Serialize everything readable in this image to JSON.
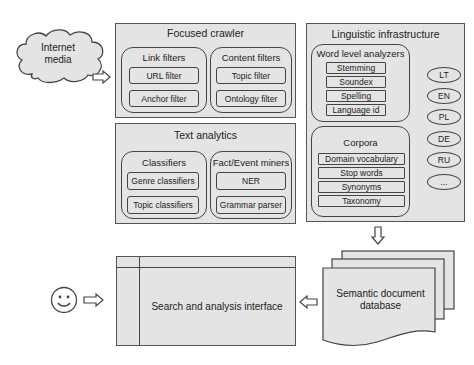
{
  "source": {
    "label_line1": "Internet",
    "label_line2": "media",
    "icon": "cloud-icon"
  },
  "focused_crawler": {
    "title": "Focused crawler",
    "link_filters": {
      "title": "Link filters",
      "items": [
        "URL filter",
        "Anchor filter"
      ]
    },
    "content_filters": {
      "title": "Content filters",
      "items": [
        "Topic filter",
        "Ontology filter"
      ]
    }
  },
  "text_analytics": {
    "title": "Text analytics",
    "classifiers": {
      "title": "Classifiers",
      "items": [
        "Genre classifiers",
        "Topic classifiers"
      ]
    },
    "fact_event_miners": {
      "title": "Fact/Event miners",
      "items": [
        "NER",
        "Grammar parser"
      ]
    }
  },
  "linguistic_infrastructure": {
    "title": "Linguistic infrastructure",
    "word_level_analyzers": {
      "title": "Word level analyzers",
      "items": [
        "Stemming",
        "Soundex",
        "Spelling",
        "Language id"
      ]
    },
    "corpora": {
      "title": "Corpora",
      "items": [
        "Domain vocabulary",
        "Stop words",
        "Synonyms",
        "Taxonomy"
      ]
    },
    "languages": [
      "LT",
      "EN",
      "PL",
      "DE",
      "RU",
      "..."
    ]
  },
  "database": {
    "label_line1": "Semantic document",
    "label_line2": "database",
    "icon": "document-stack-icon"
  },
  "interface": {
    "label": "Search and analysis interface"
  },
  "user": {
    "icon": "smiley-user-icon"
  },
  "colors": {
    "fill": "#e4e4e4",
    "stroke": "#444444",
    "background": "#ffffff"
  }
}
